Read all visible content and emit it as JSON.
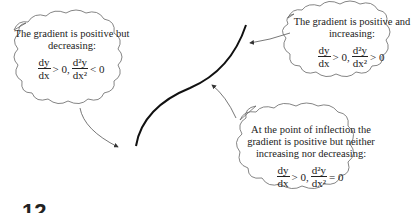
{
  "diagram": {
    "type": "curve-with-annotations",
    "curve": "S-shaped increasing curve with a point of inflection",
    "annotations": [
      {
        "id": "concave",
        "text": "The gradient is positive but decreasing:",
        "math": {
          "first": {
            "num": "dy",
            "den": "dx",
            "rel": "> 0,"
          },
          "second": {
            "num": "d²y",
            "den": "dx²",
            "rel": "< 0"
          }
        }
      },
      {
        "id": "convex",
        "text": "The gradient is positive and increasing:",
        "math": {
          "first": {
            "num": "dy",
            "den": "dx",
            "rel": "> 0,"
          },
          "second": {
            "num": "d²y",
            "den": "dx²",
            "rel": "> 0"
          }
        }
      },
      {
        "id": "inflection",
        "text": "At the point of inflection the gradient is positive but neither increasing nor decreasing:",
        "math": {
          "first": {
            "num": "dy",
            "den": "dx",
            "rel": "> 0,"
          },
          "second": {
            "num": "d²y",
            "den": "dx²",
            "rel": "= 0"
          }
        }
      }
    ],
    "clipped_bottom_text": "12"
  }
}
